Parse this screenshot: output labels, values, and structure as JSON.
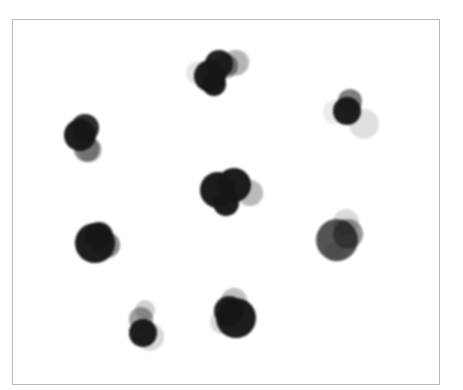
{
  "figure": {
    "background": "#ffffff",
    "frame": {
      "x": 12,
      "y": 19,
      "width": 428,
      "height": 366,
      "border_color": "#b9b9b9"
    },
    "blob_color": "#141414",
    "blur_px": 1.2,
    "clusters": [
      {
        "name": "top",
        "circles": [
          {
            "cx": 238,
            "cy": 62,
            "r": 12,
            "o": 0.14
          },
          {
            "cx": 235,
            "cy": 63,
            "r": 13,
            "o": 0.22
          },
          {
            "cx": 198,
            "cy": 73,
            "r": 12,
            "o": 0.1
          },
          {
            "cx": 226,
            "cy": 66,
            "r": 12,
            "o": 0.45
          },
          {
            "cx": 219,
            "cy": 64,
            "r": 14,
            "o": 0.95
          },
          {
            "cx": 210,
            "cy": 76,
            "r": 16,
            "o": 0.97
          },
          {
            "cx": 214,
            "cy": 84,
            "r": 12,
            "o": 0.97
          }
        ]
      },
      {
        "name": "upper-left",
        "circles": [
          {
            "cx": 90,
            "cy": 150,
            "r": 12,
            "o": 0.2
          },
          {
            "cx": 87,
            "cy": 149,
            "r": 13,
            "o": 0.5
          },
          {
            "cx": 85,
            "cy": 128,
            "r": 14,
            "o": 0.9
          },
          {
            "cx": 80,
            "cy": 135,
            "r": 16,
            "o": 0.97
          }
        ]
      },
      {
        "name": "upper-right",
        "circles": [
          {
            "cx": 364,
            "cy": 124,
            "r": 15,
            "o": 0.12
          },
          {
            "cx": 335,
            "cy": 112,
            "r": 12,
            "o": 0.08
          },
          {
            "cx": 350,
            "cy": 101,
            "r": 12,
            "o": 0.55
          },
          {
            "cx": 347,
            "cy": 111,
            "r": 14,
            "o": 0.97
          }
        ]
      },
      {
        "name": "center",
        "circles": [
          {
            "cx": 250,
            "cy": 193,
            "r": 13,
            "o": 0.3
          },
          {
            "cx": 218,
            "cy": 190,
            "r": 18,
            "o": 0.97
          },
          {
            "cx": 234,
            "cy": 185,
            "r": 17,
            "o": 0.97
          },
          {
            "cx": 226,
            "cy": 203,
            "r": 13,
            "o": 0.97
          }
        ]
      },
      {
        "name": "mid-left",
        "circles": [
          {
            "cx": 107,
            "cy": 245,
            "r": 13,
            "o": 0.5
          },
          {
            "cx": 95,
            "cy": 243,
            "r": 20,
            "o": 0.97
          },
          {
            "cx": 99,
            "cy": 236,
            "r": 14,
            "o": 0.9
          }
        ]
      },
      {
        "name": "mid-right",
        "circles": [
          {
            "cx": 346,
            "cy": 222,
            "r": 13,
            "o": 0.14
          },
          {
            "cx": 335,
            "cy": 252,
            "r": 10,
            "o": 0.1
          },
          {
            "cx": 348,
            "cy": 234,
            "r": 15,
            "o": 0.45
          },
          {
            "cx": 337,
            "cy": 240,
            "r": 21,
            "o": 0.72
          }
        ]
      },
      {
        "name": "bottom-left",
        "circles": [
          {
            "cx": 145,
            "cy": 310,
            "r": 10,
            "o": 0.18
          },
          {
            "cx": 150,
            "cy": 337,
            "r": 14,
            "o": 0.15
          },
          {
            "cx": 141,
            "cy": 319,
            "r": 12,
            "o": 0.42
          },
          {
            "cx": 143,
            "cy": 333,
            "r": 14,
            "o": 0.97
          }
        ]
      },
      {
        "name": "bottom-center",
        "circles": [
          {
            "cx": 234,
            "cy": 301,
            "r": 13,
            "o": 0.28
          },
          {
            "cx": 222,
            "cy": 322,
            "r": 12,
            "o": 0.15
          },
          {
            "cx": 229,
            "cy": 311,
            "r": 15,
            "o": 0.95
          },
          {
            "cx": 236,
            "cy": 318,
            "r": 20,
            "o": 0.97
          }
        ]
      }
    ]
  }
}
